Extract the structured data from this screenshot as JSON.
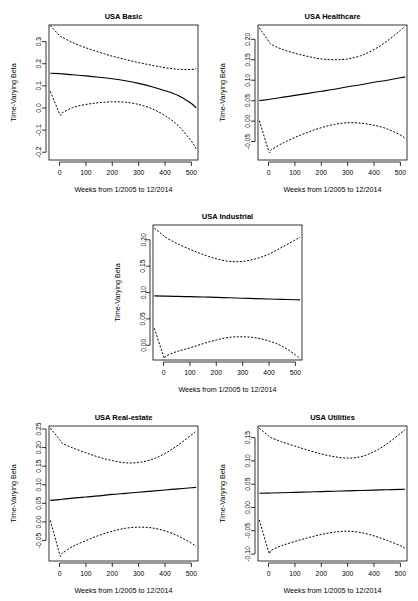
{
  "figure": {
    "name": "time-varying-beta-panels",
    "background": "#ffffff",
    "ink": "#000000",
    "panel_count": 5
  },
  "common": {
    "xlabel": "Weeks from 1/2005 to 12/2014",
    "ylabel": "Time-Varying Beta",
    "xticks": [
      0,
      100,
      200,
      300,
      400,
      500
    ],
    "xticklabels": [
      "0",
      "100",
      "200",
      "300",
      "400",
      "500"
    ],
    "xlim": [
      -40,
      525
    ],
    "series_names": [
      "upper-ci",
      "fitted-beta",
      "lower-ci"
    ]
  },
  "chart_data": [
    {
      "type": "line",
      "name": "usa-basic",
      "title": "USA Basic",
      "xlabel": "Weeks from 1/2005 to 12/2014",
      "ylabel": "Time-Varying Beta",
      "xlim": [
        -40,
        525
      ],
      "ylim": [
        -0.235,
        0.375
      ],
      "xticks": [
        0,
        100,
        200,
        300,
        400,
        500
      ],
      "yticks": [
        -0.2,
        -0.1,
        0.0,
        0.1,
        0.2,
        0.3
      ],
      "yticklabels": [
        "-0.2",
        "-0.1",
        "0.0",
        "0.1",
        "0.2",
        "0.3"
      ],
      "grid": false,
      "legend": "none",
      "x": [
        -35,
        0,
        10,
        50,
        100,
        150,
        200,
        250,
        300,
        350,
        400,
        450,
        500,
        518
      ],
      "series": [
        {
          "name": "upper-ci",
          "style": "dashed",
          "values": [
            0.372,
            0.327,
            0.32,
            0.295,
            0.272,
            0.252,
            0.234,
            0.219,
            0.205,
            0.193,
            0.182,
            0.175,
            0.174,
            0.178
          ]
        },
        {
          "name": "fitted-beta",
          "style": "solid",
          "values": [
            0.157,
            0.155,
            0.154,
            0.15,
            0.145,
            0.139,
            0.132,
            0.123,
            0.111,
            0.096,
            0.078,
            0.056,
            0.02,
            0.0
          ]
        },
        {
          "name": "lower-ci",
          "style": "dashed",
          "values": [
            0.075,
            -0.026,
            -0.022,
            0.002,
            0.016,
            0.024,
            0.028,
            0.026,
            0.016,
            -0.003,
            -0.035,
            -0.08,
            -0.15,
            -0.185
          ]
        }
      ]
    },
    {
      "type": "line",
      "name": "usa-healthcare",
      "title": "USA Healthcare",
      "xlabel": "Weeks from 1/2005 to 12/2014",
      "ylabel": "Time-Varying Beta",
      "xlim": [
        -40,
        525
      ],
      "ylim": [
        -0.095,
        0.235
      ],
      "xticks": [
        0,
        100,
        200,
        300,
        400,
        500
      ],
      "yticks": [
        -0.05,
        0.0,
        0.05,
        0.1,
        0.15,
        0.2
      ],
      "yticklabels": [
        "-0.05",
        "0.00",
        "0.05",
        "0.10",
        "0.15",
        "0.20"
      ],
      "grid": false,
      "legend": "none",
      "x": [
        -35,
        0,
        10,
        50,
        100,
        150,
        200,
        250,
        300,
        350,
        400,
        450,
        500,
        518
      ],
      "series": [
        {
          "name": "upper-ci",
          "style": "dashed",
          "values": [
            0.228,
            0.196,
            0.188,
            0.176,
            0.166,
            0.158,
            0.152,
            0.15,
            0.152,
            0.16,
            0.175,
            0.196,
            0.222,
            0.232
          ]
        },
        {
          "name": "fitted-beta",
          "style": "solid",
          "values": [
            0.05,
            0.053,
            0.054,
            0.058,
            0.063,
            0.068,
            0.073,
            0.078,
            0.084,
            0.089,
            0.095,
            0.1,
            0.106,
            0.108
          ]
        },
        {
          "name": "lower-ci",
          "style": "dashed",
          "values": [
            0.001,
            -0.072,
            -0.07,
            -0.055,
            -0.04,
            -0.027,
            -0.016,
            -0.008,
            -0.004,
            -0.005,
            -0.01,
            -0.019,
            -0.034,
            -0.042
          ]
        }
      ]
    },
    {
      "type": "line",
      "name": "usa-industrial",
      "title": "USA Industrial",
      "xlabel": "Weeks from 1/2005 to 12/2014",
      "ylabel": "Time-Varying Beta",
      "xlim": [
        -40,
        525
      ],
      "ylim": [
        -0.028,
        0.228
      ],
      "xticks": [
        0,
        100,
        200,
        300,
        400,
        500
      ],
      "yticks": [
        0.0,
        0.05,
        0.1,
        0.15,
        0.2
      ],
      "yticklabels": [
        "0.00",
        "0.05",
        "0.10",
        "0.15",
        "0.20"
      ],
      "grid": false,
      "legend": "none",
      "x": [
        -35,
        0,
        10,
        50,
        100,
        150,
        200,
        250,
        300,
        350,
        400,
        450,
        500,
        518
      ],
      "series": [
        {
          "name": "upper-ci",
          "style": "dashed",
          "values": [
            0.222,
            0.208,
            0.204,
            0.193,
            0.182,
            0.172,
            0.164,
            0.159,
            0.159,
            0.164,
            0.173,
            0.186,
            0.2,
            0.205
          ]
        },
        {
          "name": "fitted-beta",
          "style": "solid",
          "values": [
            0.0935,
            0.0932,
            0.0931,
            0.0927,
            0.0921,
            0.0915,
            0.0908,
            0.09,
            0.0892,
            0.0884,
            0.0876,
            0.0869,
            0.0862,
            0.0859
          ]
        },
        {
          "name": "lower-ci",
          "style": "dashed",
          "values": [
            0.032,
            -0.021,
            -0.02,
            -0.012,
            -0.005,
            0.003,
            0.01,
            0.015,
            0.016,
            0.014,
            0.008,
            -0.002,
            -0.018,
            -0.026
          ]
        }
      ]
    },
    {
      "type": "line",
      "name": "usa-real-estate",
      "title": "USA Real-estate",
      "xlabel": "Weeks from 1/2005 to 12/2014",
      "ylabel": "Time-Varying Beta",
      "xlim": [
        -40,
        525
      ],
      "ylim": [
        -0.105,
        0.258
      ],
      "xticks": [
        0,
        100,
        200,
        300,
        400,
        500
      ],
      "yticks": [
        -0.05,
        0.0,
        0.05,
        0.1,
        0.15,
        0.2,
        0.25
      ],
      "yticklabels": [
        "-0.05",
        "0.00",
        "0.05",
        "0.10",
        "0.15",
        "0.20",
        "0.25"
      ],
      "grid": false,
      "legend": "none",
      "x": [
        -35,
        0,
        10,
        50,
        100,
        150,
        200,
        250,
        300,
        350,
        400,
        450,
        500,
        518
      ],
      "series": [
        {
          "name": "upper-ci",
          "style": "dashed",
          "values": [
            0.252,
            0.222,
            0.212,
            0.199,
            0.186,
            0.174,
            0.165,
            0.159,
            0.16,
            0.168,
            0.184,
            0.207,
            0.234,
            0.244
          ]
        },
        {
          "name": "fitted-beta",
          "style": "solid",
          "values": [
            0.058,
            0.06,
            0.061,
            0.064,
            0.067,
            0.07,
            0.074,
            0.077,
            0.08,
            0.083,
            0.086,
            0.089,
            0.092,
            0.093
          ]
        },
        {
          "name": "lower-ci",
          "style": "dashed",
          "values": [
            0.004,
            -0.086,
            -0.084,
            -0.066,
            -0.05,
            -0.036,
            -0.025,
            -0.017,
            -0.014,
            -0.016,
            -0.024,
            -0.038,
            -0.057,
            -0.066
          ]
        }
      ]
    },
    {
      "type": "line",
      "name": "usa-utilities",
      "title": "USA Utilities",
      "xlabel": "Weeks from 1/2005 to 12/2014",
      "ylabel": "Time-Varying Beta",
      "xlim": [
        -40,
        525
      ],
      "ylim": [
        -0.115,
        0.175
      ],
      "xticks": [
        0,
        100,
        200,
        300,
        400,
        500
      ],
      "yticks": [
        -0.1,
        -0.05,
        0.0,
        0.05,
        0.1,
        0.15
      ],
      "yticklabels": [
        "-0.10",
        "-0.05",
        "0.00",
        "0.05",
        "0.10",
        "0.15"
      ],
      "grid": false,
      "legend": "none",
      "x": [
        -35,
        0,
        10,
        50,
        100,
        150,
        200,
        250,
        300,
        350,
        400,
        450,
        500,
        518
      ],
      "series": [
        {
          "name": "upper-ci",
          "style": "dashed",
          "values": [
            0.17,
            0.154,
            0.15,
            0.141,
            0.132,
            0.123,
            0.115,
            0.109,
            0.106,
            0.109,
            0.12,
            0.137,
            0.159,
            0.167
          ]
        },
        {
          "name": "fitted-beta",
          "style": "solid",
          "values": [
            0.0305,
            0.0309,
            0.0311,
            0.0317,
            0.0325,
            0.0333,
            0.0341,
            0.0349,
            0.0357,
            0.0365,
            0.0373,
            0.0381,
            0.0389,
            0.0392
          ]
        },
        {
          "name": "lower-ci",
          "style": "dashed",
          "values": [
            -0.027,
            -0.095,
            -0.092,
            -0.082,
            -0.073,
            -0.065,
            -0.058,
            -0.053,
            -0.051,
            -0.054,
            -0.061,
            -0.071,
            -0.082,
            -0.088
          ]
        }
      ]
    }
  ]
}
